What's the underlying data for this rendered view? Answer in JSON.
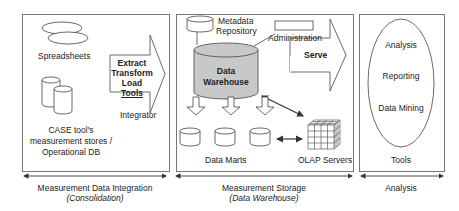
{
  "sections": {
    "integration": {
      "spreadsheets": "Spreadsheets",
      "case_line1": "CASE tool's",
      "case_line2": "measurement stores /",
      "case_line3": "Operational DB",
      "etl_line1": "Extract",
      "etl_line2": "Transform",
      "etl_line3": "Load",
      "etl_line4": "Tools",
      "integrator": "Integrator"
    },
    "storage": {
      "metadata_line1": "Metadata",
      "metadata_line2": "Repository",
      "administration": "Administration",
      "dw_line1": "Data",
      "dw_line2": "Warehouse",
      "serve": "Serve",
      "data_marts": "Data Marts",
      "olap": "OLAP Servers"
    },
    "analysis": {
      "item1": "Analysis",
      "item2": "Reporting",
      "item3": "Data Mining",
      "tools": "Tools"
    }
  },
  "footer": {
    "integration_title": "Measurement Data Integration",
    "integration_sub": "(Consolidation)",
    "storage_title": "Measurement Storage",
    "storage_sub": "(Data Warehouse)",
    "analysis_title": "Analysis"
  },
  "colors": {
    "warehouse_fill": "#c8c8c8",
    "line": "#555555"
  }
}
